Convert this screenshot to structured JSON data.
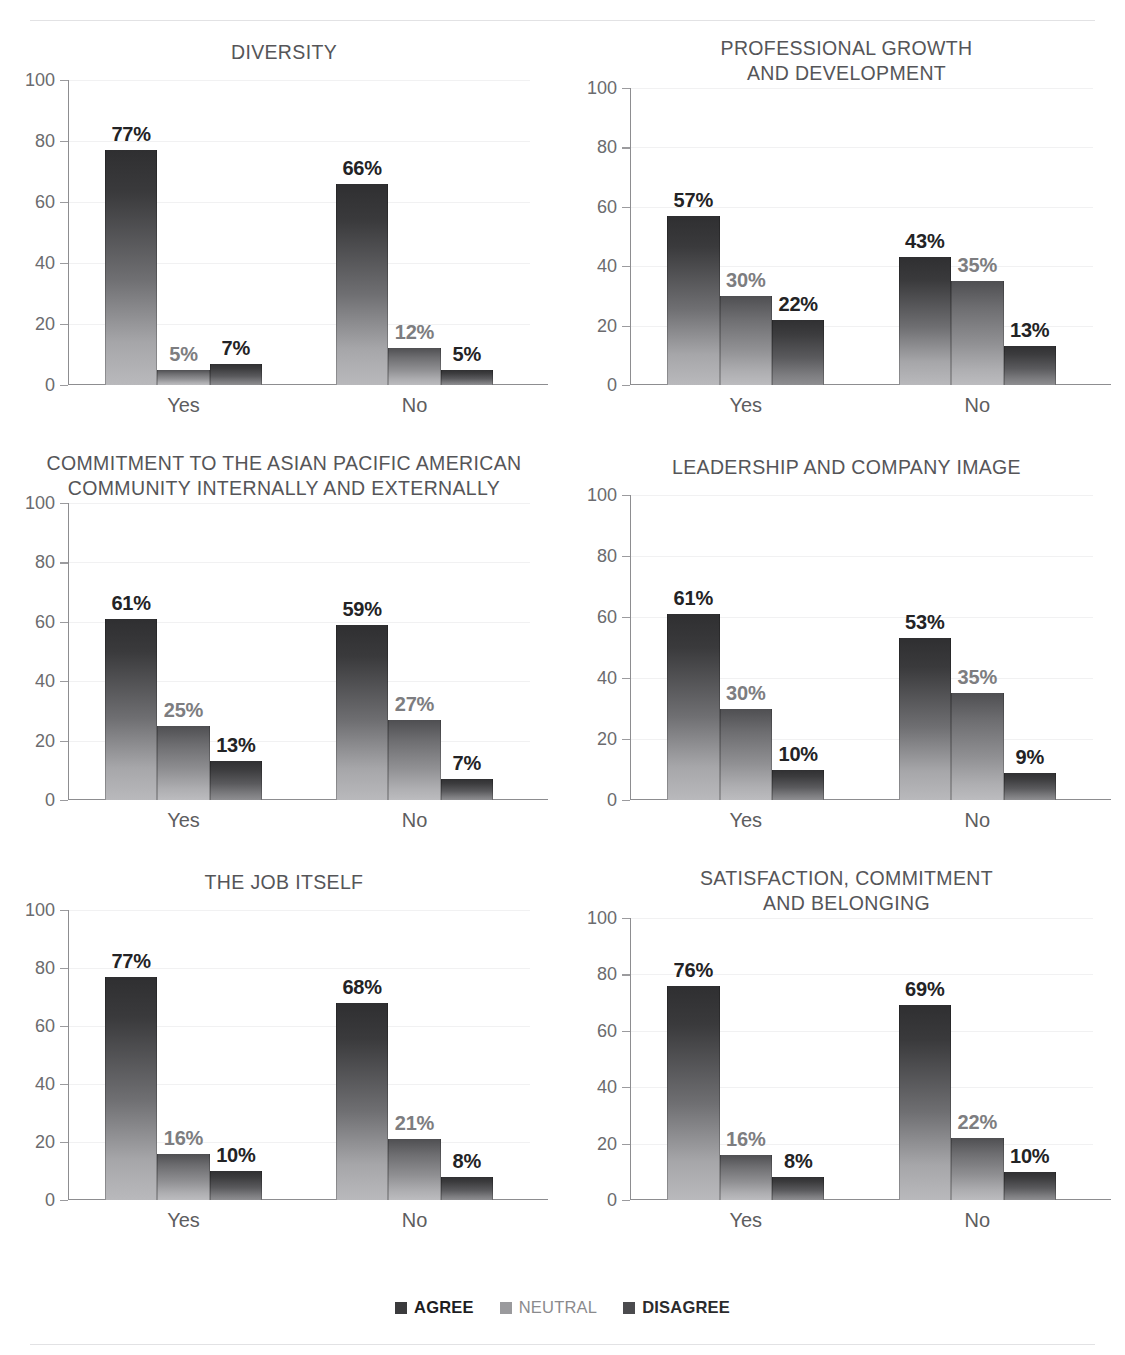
{
  "page": {
    "cut_off_header": "",
    "background": "#ffffff"
  },
  "legend": {
    "position": "bottom-center",
    "items": [
      {
        "label": "AGREE",
        "color": "#3b3b3d",
        "icon": "square-swatch"
      },
      {
        "label": "NEUTRAL",
        "color": "#9a9a9d",
        "icon": "square-swatch"
      },
      {
        "label": "DISAGREE",
        "color": "#4b4b4e",
        "icon": "square-swatch"
      }
    ]
  },
  "axis": {
    "yticks": [
      "100",
      "80",
      "60",
      "40",
      "20",
      "0"
    ],
    "ylim": [
      0,
      100
    ],
    "categories": [
      "Yes",
      "No"
    ]
  },
  "chart_data": [
    {
      "type": "bar",
      "title": "DIVERSITY",
      "categories": [
        "Yes",
        "No"
      ],
      "series": [
        {
          "name": "AGREE",
          "values": [
            77,
            66
          ]
        },
        {
          "name": "NEUTRAL",
          "values": [
            5,
            12
          ]
        },
        {
          "name": "DISAGREE",
          "values": [
            7,
            5
          ]
        }
      ],
      "labels": [
        [
          "77%",
          "5%",
          "7%"
        ],
        [
          "66%",
          "12%",
          "5%"
        ]
      ],
      "xlabel": "",
      "ylabel": "",
      "ylim": [
        0,
        100
      ],
      "yticks": [
        0,
        20,
        40,
        60,
        80,
        100
      ],
      "grid": true,
      "legend": "bottom"
    },
    {
      "type": "bar",
      "title": "PROFESSIONAL GROWTH\nAND DEVELOPMENT",
      "categories": [
        "Yes",
        "No"
      ],
      "series": [
        {
          "name": "AGREE",
          "values": [
            57,
            43
          ]
        },
        {
          "name": "NEUTRAL",
          "values": [
            30,
            35
          ]
        },
        {
          "name": "DISAGREE",
          "values": [
            22,
            13
          ]
        }
      ],
      "labels": [
        [
          "57%",
          "30%",
          "22%"
        ],
        [
          "43%",
          "35%",
          "13%"
        ]
      ],
      "xlabel": "",
      "ylabel": "",
      "ylim": [
        0,
        100
      ],
      "yticks": [
        0,
        20,
        40,
        60,
        80,
        100
      ],
      "grid": true,
      "legend": "bottom"
    },
    {
      "type": "bar",
      "title": "COMMITMENT TO THE ASIAN PACIFIC AMERICAN\nCOMMUNITY INTERNALLY AND EXTERNALLY",
      "categories": [
        "Yes",
        "No"
      ],
      "series": [
        {
          "name": "AGREE",
          "values": [
            61,
            59
          ]
        },
        {
          "name": "NEUTRAL",
          "values": [
            25,
            27
          ]
        },
        {
          "name": "DISAGREE",
          "values": [
            13,
            7
          ]
        }
      ],
      "labels": [
        [
          "61%",
          "25%",
          "13%"
        ],
        [
          "59%",
          "27%",
          "7%"
        ]
      ],
      "xlabel": "",
      "ylabel": "",
      "ylim": [
        0,
        100
      ],
      "yticks": [
        0,
        20,
        40,
        60,
        80,
        100
      ],
      "grid": true,
      "legend": "bottom"
    },
    {
      "type": "bar",
      "title": "LEADERSHIP AND COMPANY IMAGE",
      "categories": [
        "Yes",
        "No"
      ],
      "series": [
        {
          "name": "AGREE",
          "values": [
            61,
            53
          ]
        },
        {
          "name": "NEUTRAL",
          "values": [
            30,
            35
          ]
        },
        {
          "name": "DISAGREE",
          "values": [
            10,
            9
          ]
        }
      ],
      "labels": [
        [
          "61%",
          "30%",
          "10%"
        ],
        [
          "53%",
          "35%",
          "9%"
        ]
      ],
      "xlabel": "",
      "ylabel": "",
      "ylim": [
        0,
        100
      ],
      "yticks": [
        0,
        20,
        40,
        60,
        80,
        100
      ],
      "grid": true,
      "legend": "bottom"
    },
    {
      "type": "bar",
      "title": "THE JOB ITSELF",
      "categories": [
        "Yes",
        "No"
      ],
      "series": [
        {
          "name": "AGREE",
          "values": [
            77,
            68
          ]
        },
        {
          "name": "NEUTRAL",
          "values": [
            16,
            21
          ]
        },
        {
          "name": "DISAGREE",
          "values": [
            10,
            8
          ]
        }
      ],
      "labels": [
        [
          "77%",
          "16%",
          "10%"
        ],
        [
          "68%",
          "21%",
          "8%"
        ]
      ],
      "xlabel": "",
      "ylabel": "",
      "ylim": [
        0,
        100
      ],
      "yticks": [
        0,
        20,
        40,
        60,
        80,
        100
      ],
      "grid": true,
      "legend": "bottom"
    },
    {
      "type": "bar",
      "title": "SATISFACTION, COMMITMENT\nAND BELONGING",
      "categories": [
        "Yes",
        "No"
      ],
      "series": [
        {
          "name": "AGREE",
          "values": [
            76,
            69
          ]
        },
        {
          "name": "NEUTRAL",
          "values": [
            16,
            22
          ]
        },
        {
          "name": "DISAGREE",
          "values": [
            8,
            10
          ]
        }
      ],
      "labels": [
        [
          "76%",
          "16%",
          "8%"
        ],
        [
          "69%",
          "22%",
          "10%"
        ]
      ],
      "xlabel": "",
      "ylabel": "",
      "ylim": [
        0,
        100
      ],
      "yticks": [
        0,
        20,
        40,
        60,
        80,
        100
      ],
      "grid": true,
      "legend": "bottom"
    }
  ]
}
